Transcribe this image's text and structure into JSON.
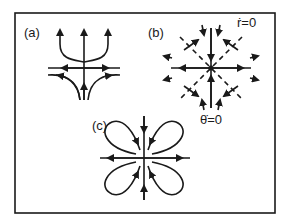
{
  "figure": {
    "frame": {
      "x": 15,
      "y": 13,
      "width": 260,
      "height": 200,
      "color": "#1a1a1a"
    },
    "panels": [
      {
        "id": "a",
        "label": "(a)",
        "center": [
          84,
          68
        ],
        "description": "Flow with one vertical trajectory and branching outward curves; horizontal axis with inflowing arrows"
      },
      {
        "id": "b",
        "label": "(b)",
        "center": [
          211,
          68
        ],
        "description": "Radial flow field with dashed nullcline diagonals",
        "annotations": {
          "r_dot_zero": "ṙ=0",
          "theta_dot_zero": "θ̇=0"
        }
      },
      {
        "id": "c",
        "label": "(c)",
        "center": [
          144,
          158
        ],
        "description": "Four-petal (clover) loops with homoclinic orbits and crossing axes"
      }
    ]
  }
}
